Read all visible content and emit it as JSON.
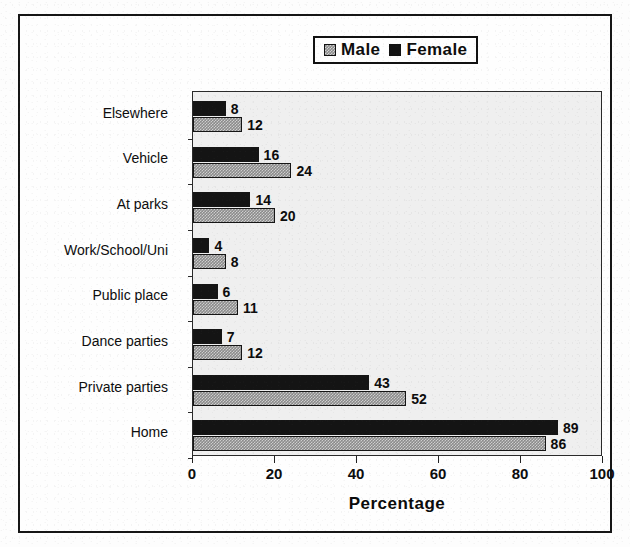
{
  "chart_data": {
    "type": "bar",
    "orientation": "horizontal",
    "title": "",
    "xlabel": "Percentage",
    "ylabel": "",
    "xlim": [
      0,
      100
    ],
    "xticks": [
      0,
      20,
      40,
      60,
      80,
      100
    ],
    "grid": false,
    "legend_position": "top-center",
    "categories": [
      "Elsewhere",
      "Vehicle",
      "At parks",
      "Work/School/Uni",
      "Public place",
      "Dance parties",
      "Private parties",
      "Home"
    ],
    "series": [
      {
        "name": "Female",
        "color": "#141414",
        "pattern": "solid-black",
        "values": [
          8,
          16,
          14,
          4,
          6,
          7,
          43,
          89
        ]
      },
      {
        "name": "Male",
        "color": "#8c8c8c",
        "pattern": "gray-checker",
        "values": [
          12,
          24,
          20,
          8,
          11,
          12,
          52,
          86
        ]
      }
    ]
  },
  "legend": {
    "entries": [
      {
        "label": "Male",
        "swatch": "gray-checker-swatch"
      },
      {
        "label": "Female",
        "swatch": "black-swatch"
      }
    ]
  },
  "axis": {
    "x_title": "Percentage",
    "x_tick_labels": [
      "0",
      "20",
      "40",
      "60",
      "80",
      "100"
    ]
  },
  "colors": {
    "female_bar": "#141414",
    "male_bar": "#8c8c8c",
    "plot_background": "#efefef",
    "frame_border": "#151515",
    "text": "#0d0d0d"
  }
}
